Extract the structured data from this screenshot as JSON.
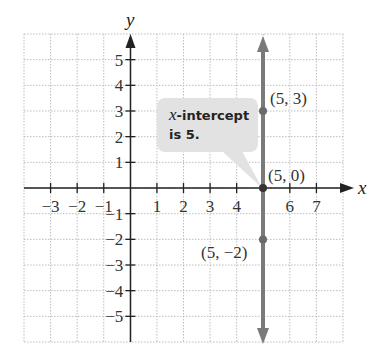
{
  "chart_data": {
    "type": "line",
    "title": "",
    "xlabel": "x",
    "ylabel": "y",
    "xlim": [
      -4,
      8
    ],
    "ylim": [
      -6,
      6
    ],
    "grid": true,
    "x_ticks": [
      -3,
      -2,
      -1,
      1,
      2,
      3,
      4,
      6,
      7
    ],
    "x_tick_labels": [
      "−3",
      "−2",
      "−1",
      "1",
      "2",
      "3",
      "4",
      "6",
      "7"
    ],
    "y_ticks": [
      5,
      4,
      3,
      2,
      1,
      -1,
      -2,
      -3,
      -4,
      -5
    ],
    "y_tick_labels": [
      "5",
      "4",
      "3",
      "2",
      "1",
      "−1",
      "−2",
      "−3",
      "−4",
      "−5"
    ],
    "series": [
      {
        "name": "x = 5",
        "type": "vertical-line",
        "x": [
          5,
          5,
          5
        ],
        "y": [
          3,
          0,
          -2
        ],
        "color": "#7a7a7a"
      }
    ],
    "points": [
      {
        "x": 5,
        "y": 3,
        "label": "(5, 3)"
      },
      {
        "x": 5,
        "y": 0,
        "label": "(5, 0)"
      },
      {
        "x": 5,
        "y": -2,
        "label": "(5, −2)"
      }
    ],
    "annotations": [
      {
        "text": "x-intercept is 5.",
        "points_to": [
          5,
          0
        ]
      }
    ]
  },
  "labels": {
    "x_axis": "x",
    "y_axis": "y",
    "pt1": "(5, 3)",
    "pt2": "(5, 0)",
    "pt3": "(5, −2)",
    "callout_var": "x",
    "callout_line1": "-intercept",
    "callout_line2": "is 5."
  },
  "colors": {
    "line": "#7a7a7a",
    "axis": "#222222",
    "grid": "#bdbdbd",
    "callout_bg": "#e2e2e2"
  }
}
